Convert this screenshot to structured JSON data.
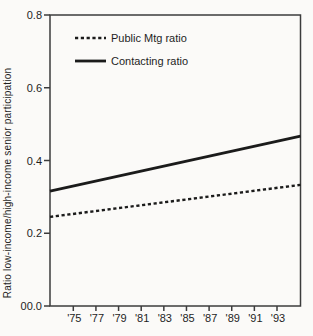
{
  "figure": {
    "background": "#fbfaf8",
    "frame_color": "#3c3c3c",
    "line_color": "#1b1b1b",
    "text_color": "#1e1e1e"
  },
  "chart_data": {
    "type": "line",
    "title": "",
    "xlabel": "",
    "ylabel": "Ratio low-income/high-income senior participation",
    "ylim": [
      0.0,
      0.8
    ],
    "y_tick_values": [
      0.8,
      0.6,
      0.4,
      0.2,
      0.0
    ],
    "y_tick_labels": [
      "0.8",
      "0.6",
      "0.4",
      "0.2",
      "00.0"
    ],
    "x_tick_labels": [
      "'75",
      "'77",
      "'79",
      "'81",
      "'83",
      "'85",
      "'87",
      "'89",
      "'91",
      "'93"
    ],
    "grid": false,
    "legend": {
      "position": "top-left-inside",
      "entries": [
        "Public Mtg ratio",
        "Contacting ratio"
      ]
    },
    "series": [
      {
        "name": "Public Mtg ratio",
        "style": "dashed",
        "axis_edge_start": 0.245,
        "axis_edge_end": 0.333,
        "values_at_ticks": [
          0.25,
          0.26,
          0.27,
          0.28,
          0.28,
          0.29,
          0.3,
          0.31,
          0.32,
          0.32
        ]
      },
      {
        "name": "Contacting ratio",
        "style": "solid",
        "axis_edge_start": 0.316,
        "axis_edge_end": 0.467,
        "values_at_ticks": [
          0.33,
          0.34,
          0.36,
          0.37,
          0.38,
          0.4,
          0.41,
          0.43,
          0.44,
          0.45
        ]
      }
    ]
  }
}
